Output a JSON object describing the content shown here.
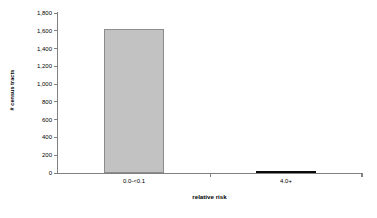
{
  "chart_data": {
    "type": "bar",
    "title": "",
    "subtitle": "",
    "xlabel": "relative risk",
    "ylabel": "# census tracts",
    "categories": [
      "0.0-<0.1",
      "4.0+"
    ],
    "values": [
      1615,
      25
    ],
    "series": [
      {
        "name": "# census tracts",
        "values": [
          1615,
          25
        ]
      }
    ],
    "ylim": [
      0,
      1800
    ],
    "ytick_values": [
      0,
      200,
      400,
      600,
      800,
      1000,
      1200,
      1400,
      1600,
      1800
    ],
    "ytick_labels": [
      "0",
      "200",
      "400",
      "600",
      "800",
      "1,000",
      "1,200",
      "1,400",
      "1,600",
      "1,800"
    ],
    "grid": false,
    "legend": false,
    "legend_position": "none",
    "bar_colors": [
      "#c2c2c2",
      "#0a0a0a"
    ],
    "bar_border_colors": [
      "#8c8c8c",
      "#0a0a0a"
    ],
    "axis_color": "#808080",
    "background_color": "#ffffff",
    "text_color": "#000000"
  }
}
